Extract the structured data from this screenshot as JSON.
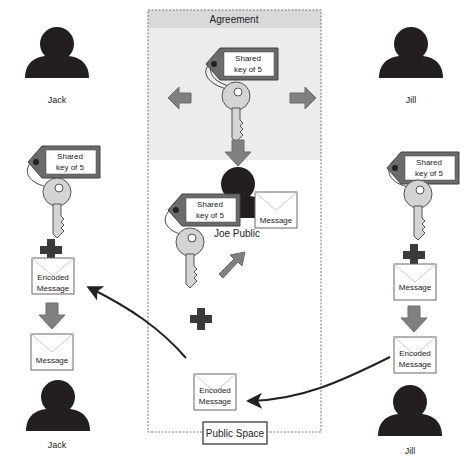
{
  "diagram": {
    "type": "key-exchange-illustration",
    "agreement_panel": {
      "title": "Agreement"
    },
    "public_space": {
      "label": "Public Space"
    },
    "key_tag_label_line1": "Shared",
    "key_tag_label_line2": "key of 5",
    "people": {
      "jack_top": "Jack",
      "jill_top": "Jill",
      "joe": "Joe Public",
      "jack_bottom": "Jack",
      "jill_bottom": "Jill"
    },
    "messages": {
      "joe_message": "Message",
      "jack_encoded_line1": "Encoded",
      "jack_encoded_line2": "Message",
      "jack_decoded": "Message",
      "jill_message": "Message",
      "jill_encoded_line1": "Encoded",
      "jill_encoded_line2": "Message",
      "public_encoded_line1": "Encoded",
      "public_encoded_line2": "Message"
    },
    "colors": {
      "person": "#231f20",
      "arrow": "#808080",
      "arrow_stroke": "#6d6d6d",
      "key_fill": "#d4d4d4",
      "tag_border": "#5b5b5b",
      "agreement_bg": "#ececec",
      "agreement_header": "#d9d9d9",
      "plus": "#3a3a3a"
    }
  }
}
